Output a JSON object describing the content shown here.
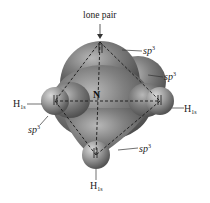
{
  "diagram": {
    "central_atom": "N",
    "lone_pair_label": "lone pair",
    "orbital_labels": [
      {
        "id": "top",
        "base": "sp",
        "sup": "3"
      },
      {
        "id": "upper-right",
        "base": "sp",
        "sup": "3"
      },
      {
        "id": "left",
        "base": "sp",
        "sup": "3"
      },
      {
        "id": "bottom-right",
        "base": "sp",
        "sup": "3"
      }
    ],
    "hydrogen_labels": [
      {
        "id": "left",
        "base": "H",
        "sub": "1s"
      },
      {
        "id": "right",
        "base": "H",
        "sub": "1s"
      },
      {
        "id": "bottom",
        "base": "H",
        "sub": "1s"
      }
    ],
    "colors": {
      "lobe_fill": "#7a7a7a",
      "lobe_highlight": "#b5b5b5",
      "lobe_shadow": "#4a4a4a",
      "h_sphere": "#9a9a9a",
      "dashed_lines": "#1a1a1a",
      "text": "#222222"
    }
  }
}
